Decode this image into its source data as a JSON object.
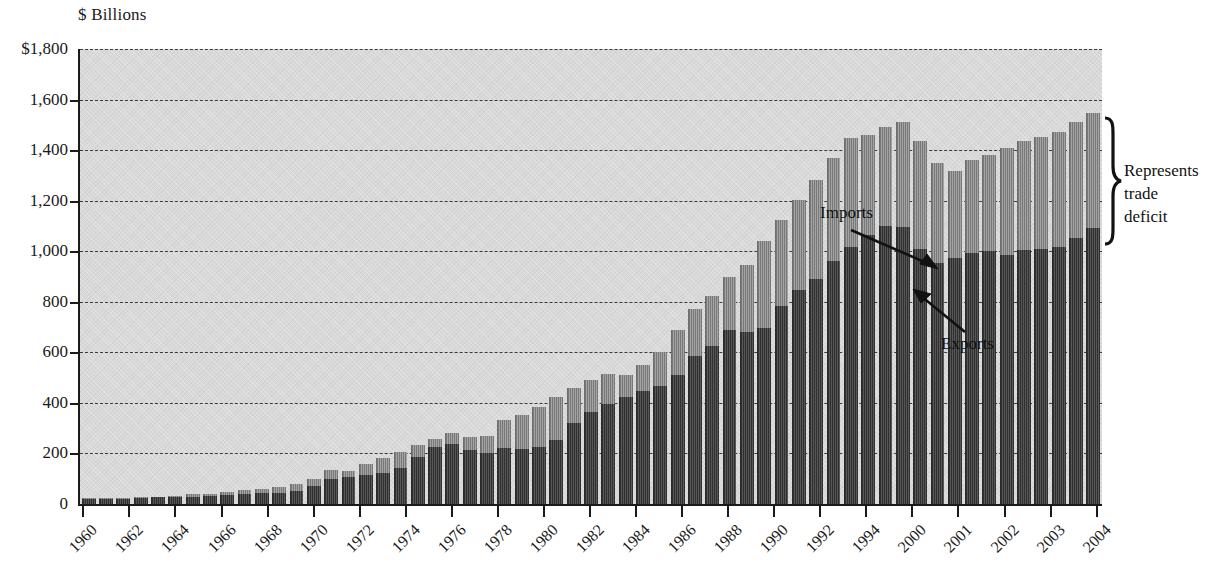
{
  "chart_data": {
    "type": "bar",
    "stacked": true,
    "title": "",
    "ylabel": "$ Billions",
    "xlabel": "",
    "ylim": [
      0,
      1800
    ],
    "yticks": [
      "$1,800",
      "1,600",
      "1,400",
      "1,200",
      "1,000",
      "800",
      "600",
      "400",
      "200",
      "0"
    ],
    "ytick_values": [
      1800,
      1600,
      1400,
      1200,
      1000,
      800,
      600,
      400,
      200,
      0
    ],
    "grid": true,
    "legend_position": "inline-annotations",
    "xtick_labels": [
      "1960",
      "1962",
      "1964",
      "1966",
      "1968",
      "1970",
      "1972",
      "1974",
      "1976",
      "1978",
      "1980",
      "1982",
      "1984",
      "1986",
      "1988",
      "1990",
      "1992",
      "1994",
      "2000",
      "2001",
      "2002",
      "2003",
      "2004"
    ],
    "annotations": [
      {
        "name": "imports",
        "text": "Imports"
      },
      {
        "name": "exports",
        "text": "Exports"
      },
      {
        "name": "trade-deficit-bracket",
        "text": "Represents\ntrade\ndeficit",
        "lines": [
          "Represents",
          "trade",
          "deficit"
        ]
      }
    ],
    "series": [
      {
        "name": "Imports",
        "color": "#9a9a9a",
        "values": [
          22,
          23,
          25,
          27,
          29,
          33,
          38,
          41,
          49,
          54,
          60,
          67,
          79,
          99,
          134,
          130,
          159,
          182,
          206,
          234,
          257,
          281,
          265,
          270,
          332,
          352,
          382,
          424,
          459,
          492,
          516,
          509,
          551,
          603,
          689,
          770,
          822,
          899,
          945,
          1042,
          1122,
          1202,
          1280,
          1368,
          1446,
          1460,
          1490,
          1512,
          1436,
          1350,
          1318,
          1360,
          1382,
          1410,
          1438,
          1452,
          1470,
          1512,
          1548
        ]
      },
      {
        "name": "Exports",
        "color": "#4a4a4a",
        "values": [
          20,
          21,
          21,
          23,
          26,
          27,
          29,
          31,
          34,
          38,
          43,
          44,
          50,
          71,
          99,
          108,
          115,
          121,
          144,
          187,
          224,
          237,
          212,
          201,
          220,
          216,
          224,
          254,
          322,
          363,
          394,
          422,
          448,
          465,
          512,
          584,
          625,
          689,
          682,
          696,
          782,
          848,
          892,
          960,
          1018,
          1064,
          1100,
          1094,
          1008,
          955,
          972,
          994,
          1002,
          986,
          1004,
          1008,
          1018,
          1052,
          1092
        ]
      }
    ],
    "x_domain": {
      "start_year": 1960,
      "end_year": 2004,
      "note": "left portion annual 1960-1994, right portion finer-grained 2000-2004"
    }
  },
  "source_note": ""
}
